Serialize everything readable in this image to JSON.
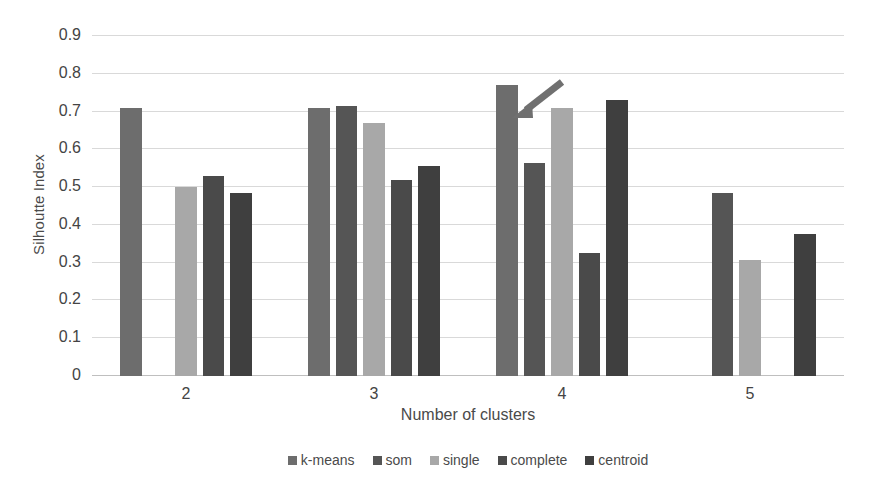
{
  "chart_data": {
    "type": "bar",
    "title": "",
    "xlabel": "Number of clusters",
    "ylabel": "Silhoutte Index",
    "categories": [
      "2",
      "3",
      "4",
      "5"
    ],
    "ylim": [
      0,
      0.9
    ],
    "yticks": [
      "0",
      "0.1",
      "0.2",
      "0.3",
      "0.4",
      "0.5",
      "0.6",
      "0.7",
      "0.8",
      "0.9"
    ],
    "ytick_values": [
      0,
      0.1,
      0.2,
      0.3,
      0.4,
      0.5,
      0.6,
      0.7,
      0.8,
      0.9
    ],
    "grid": true,
    "legend_position": "bottom",
    "series": [
      {
        "name": "k-means",
        "color": "#6d6d6d",
        "values": [
          0.71,
          0.71,
          0.77,
          null
        ]
      },
      {
        "name": "som",
        "color": "#555555",
        "values": [
          null,
          0.715,
          0.565,
          0.485
        ]
      },
      {
        "name": "single",
        "color": "#a8a8a8",
        "values": [
          0.5,
          0.67,
          0.71,
          0.307
        ]
      },
      {
        "name": "complete",
        "color": "#4a4a4a",
        "values": [
          0.53,
          0.52,
          0.325,
          null
        ]
      },
      {
        "name": "centroid",
        "color": "#3f3f3f",
        "values": [
          0.485,
          0.555,
          0.73,
          0.375
        ]
      }
    ],
    "annotations": [
      {
        "type": "arrow",
        "target_series": "k-means",
        "target_category": "4",
        "direction": "down-left",
        "color": "#707070"
      }
    ]
  }
}
